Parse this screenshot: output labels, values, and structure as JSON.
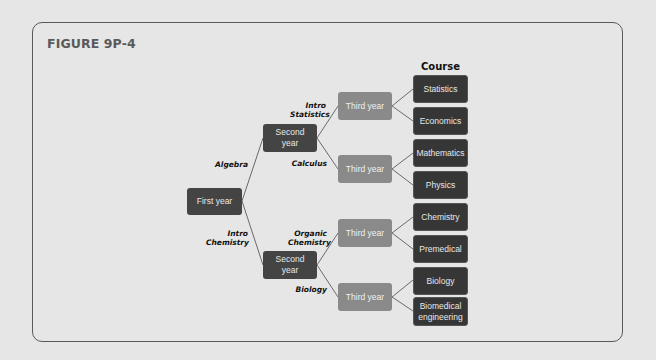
{
  "figure": {
    "title": "FIGURE 9P-4",
    "column_header": "Course"
  },
  "nodes": {
    "first_year": "First year",
    "second_year_top": "Second year",
    "second_year_bottom": "Second year",
    "third_year_1": "Third year",
    "third_year_2": "Third year",
    "third_year_3": "Third year",
    "third_year_4": "Third year"
  },
  "courses": [
    "Statistics",
    "Economics",
    "Mathematics",
    "Physics",
    "Chemistry",
    "Premedical",
    "Biology",
    "Biomedical engineering"
  ],
  "edge_labels": {
    "algebra": "Algebra",
    "intro_chemistry": "Intro Chemistry",
    "intro_statistics": "Intro Statistics",
    "calculus": "Calculus",
    "organic_chemistry": "Organic Chemistry",
    "biology": "Biology"
  },
  "colors": {
    "first_second": "#444444",
    "third": "#8a8a8a",
    "course": "#363636",
    "lines": "#6a6a6a"
  }
}
